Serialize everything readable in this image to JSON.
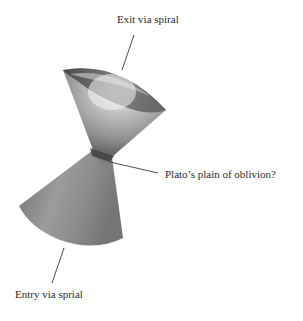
{
  "figure": {
    "labels": {
      "exit": "Exit via spiral",
      "waist": "Plato’s plain of oblivion?",
      "entry": "Entry via sprial"
    },
    "colors": {
      "background": "#ffffff",
      "cone_light": "#e6e6e6",
      "cone_mid": "#9a9a9a",
      "cone_dark": "#4a4a4a",
      "leader_line": "#3a3a3a",
      "text": "#2a2a2a"
    }
  }
}
